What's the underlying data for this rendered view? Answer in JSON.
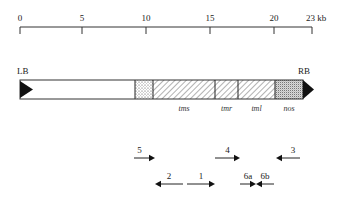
{
  "scale": {
    "unit": "kb",
    "ticks": [
      {
        "value": "0",
        "x": 20
      },
      {
        "value": "5",
        "x": 82
      },
      {
        "value": "10",
        "x": 146
      },
      {
        "value": "15",
        "x": 210
      },
      {
        "value": "20",
        "x": 274
      },
      {
        "value": "23 kb",
        "x": 312
      }
    ]
  },
  "borders": {
    "left": "LB",
    "right": "RB"
  },
  "segments": [
    {
      "name": "",
      "pattern": "blank",
      "x1": 20,
      "x2": 135
    },
    {
      "name": "",
      "pattern": "dots",
      "x1": 135,
      "x2": 153
    },
    {
      "name": "tms",
      "pattern": "hatch",
      "x1": 153,
      "x2": 215
    },
    {
      "name": "tmr",
      "pattern": "hatch",
      "x1": 215,
      "x2": 238
    },
    {
      "name": "tml",
      "pattern": "hatch",
      "x1": 238,
      "x2": 275
    },
    {
      "name": "nos",
      "pattern": "stipple",
      "x1": 275,
      "x2": 303
    }
  ],
  "gene_labels": {
    "tms": "tms",
    "tmr": "tmr",
    "tml": "tml",
    "nos": "nos"
  },
  "primers": [
    {
      "label": "5",
      "direction": "right",
      "x1": 134,
      "x2": 155,
      "y": 158
    },
    {
      "label": "4",
      "direction": "right",
      "x1": 215,
      "x2": 240,
      "y": 158
    },
    {
      "label": "3",
      "direction": "left",
      "x1": 276,
      "x2": 300,
      "y": 158
    },
    {
      "label": "2",
      "direction": "left",
      "x1": 155,
      "x2": 183,
      "y": 184
    },
    {
      "label": "1",
      "direction": "right",
      "x1": 187,
      "x2": 215,
      "y": 184
    },
    {
      "label": "6a",
      "direction": "right",
      "x1": 240,
      "x2": 256,
      "y": 184
    },
    {
      "label": "6b",
      "direction": "left",
      "x1": 256,
      "x2": 274,
      "y": 184
    }
  ]
}
